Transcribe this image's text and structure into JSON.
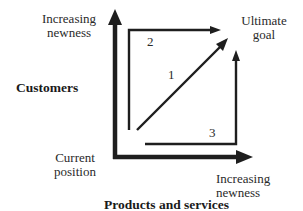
{
  "diagram": {
    "type": "growth-path-matrix",
    "y_axis": {
      "title": "Customers",
      "end_label_line1": "Increasing",
      "end_label_line2": "newness"
    },
    "x_axis": {
      "title": "Products and services",
      "end_label_line1": "Increasing",
      "end_label_line2": "newness"
    },
    "origin": {
      "label_line1": "Current",
      "label_line2": "position"
    },
    "goal": {
      "label_line1": "Ultimate",
      "label_line2": "goal"
    },
    "paths": [
      {
        "id": "1",
        "label": "1",
        "description": "diagonal path from current position directly to ultimate goal"
      },
      {
        "id": "2",
        "label": "2",
        "description": "path up along customers first, then across products and services"
      },
      {
        "id": "3",
        "label": "3",
        "description": "path across products and services first, then up along customers"
      }
    ],
    "colors": {
      "line": "#1e1e1e",
      "background": "#ffffff"
    }
  }
}
